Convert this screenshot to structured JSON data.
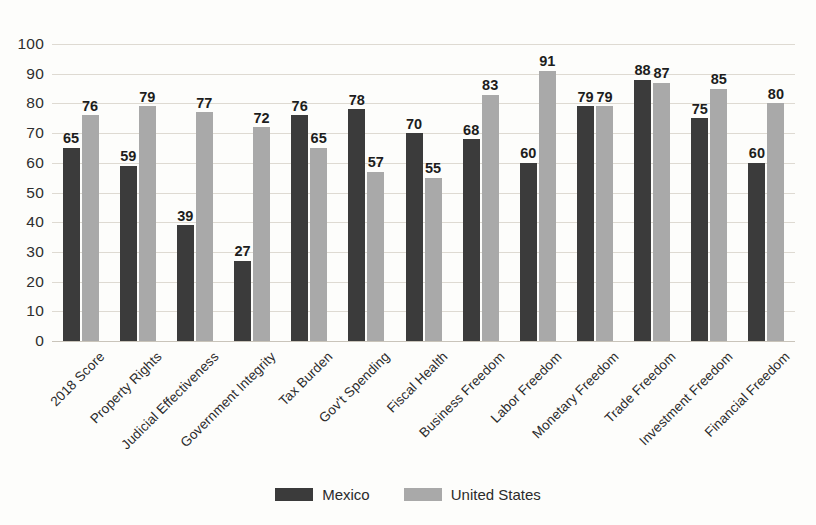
{
  "chart_data": {
    "type": "bar",
    "title": "",
    "subtitle": "",
    "xlabel": "",
    "ylabel": "",
    "ylim": [
      0,
      100
    ],
    "ytick_step": 10,
    "yticks": [
      100,
      90,
      80,
      70,
      60,
      50,
      40,
      30,
      20,
      10,
      0
    ],
    "grid": true,
    "legend_position": "bottom-center",
    "categories": [
      "2018 Score",
      "Property Rights",
      "Judicial Effectiveness",
      "Government Integrity",
      "Tax Burden",
      "Gov't Spending",
      "Fiscal Health",
      "Business Freedom",
      "Labor Freedom",
      "Monetary Freedom",
      "Trade Freedom",
      "Investment Freedom",
      "Financial Freedom"
    ],
    "series": [
      {
        "name": "Mexico",
        "color": "#3b3b3b",
        "values": [
          65,
          59,
          39,
          27,
          76,
          78,
          70,
          68,
          60,
          79,
          88,
          75,
          60
        ]
      },
      {
        "name": "United States",
        "color": "#a9a9a9",
        "values": [
          76,
          79,
          77,
          72,
          65,
          57,
          55,
          83,
          91,
          79,
          87,
          85,
          80
        ]
      }
    ]
  },
  "legend": {
    "items": [
      {
        "label": "Mexico",
        "color": "#3b3b3b"
      },
      {
        "label": "United States",
        "color": "#a9a9a9"
      }
    ]
  },
  "colors": {
    "background": "#fdfdfb",
    "gridline": "#dedad2",
    "axis": "#c9c4ba",
    "text": "#2b2b2b",
    "series_mexico": "#3b3b3b",
    "series_united_states": "#a9a9a9"
  }
}
